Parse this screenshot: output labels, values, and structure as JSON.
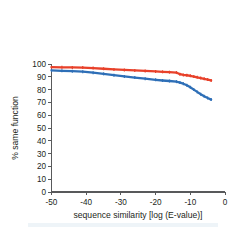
{
  "chart_data": {
    "type": "line",
    "title": "",
    "xlabel": "sequence similarity [log (E-value)]",
    "ylabel": "% same function",
    "xlim": [
      -50,
      0
    ],
    "ylim": [
      0,
      100
    ],
    "grid": false,
    "legend": "none",
    "xticks": [
      -50,
      -40,
      -30,
      -20,
      -10,
      0
    ],
    "xtick_labels": [
      "-50",
      "-40",
      "-30",
      "-20",
      "-10",
      "0"
    ],
    "yticks": [
      0,
      10,
      20,
      30,
      40,
      50,
      60,
      70,
      80,
      90,
      100
    ],
    "ytick_labels": [
      "0",
      "10",
      "20",
      "30",
      "40",
      "50",
      "60",
      "70",
      "80",
      "90",
      "100"
    ],
    "series": [
      {
        "name": "red-series",
        "color": "#e8412a",
        "x": [
          -50,
          -47,
          -44,
          -41,
          -38,
          -35,
          -32,
          -29,
          -26,
          -23,
          -20,
          -18,
          -16,
          -14,
          -13,
          -12,
          -11,
          -10,
          -9,
          -8,
          -7,
          -6,
          -5,
          -4
        ],
        "values": [
          97.5,
          97.4,
          97.3,
          97.2,
          96.8,
          96.3,
          95.8,
          95.4,
          95.0,
          94.6,
          94.2,
          93.9,
          93.6,
          93.3,
          92.0,
          91.5,
          91.2,
          90.8,
          90.2,
          89.6,
          89.0,
          88.4,
          87.8,
          87.2
        ]
      },
      {
        "name": "blue-series",
        "color": "#2e6fb7",
        "x": [
          -50,
          -47,
          -44,
          -41,
          -38,
          -35,
          -32,
          -29,
          -26,
          -23,
          -20,
          -18,
          -16,
          -14,
          -13,
          -12,
          -11,
          -10,
          -9,
          -8,
          -7,
          -6,
          -5,
          -4
        ],
        "values": [
          95.0,
          94.7,
          94.4,
          94.0,
          93.2,
          92.3,
          91.3,
          90.3,
          89.4,
          88.5,
          87.6,
          87.1,
          86.7,
          86.2,
          85.5,
          84.6,
          83.4,
          81.8,
          80.0,
          78.2,
          76.4,
          74.8,
          73.4,
          72.2
        ]
      }
    ]
  },
  "axes": {
    "x_title": "sequence similarity [log (E-value)]",
    "y_title": "% same function"
  }
}
